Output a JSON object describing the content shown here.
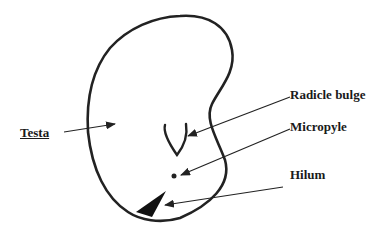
{
  "diagram": {
    "colors": {
      "ink": "#222222",
      "background": "#ffffff"
    },
    "labels": [
      {
        "id": "testa",
        "text": "Testa",
        "underlined": true
      },
      {
        "id": "radicle_bulge",
        "text": "Radicle bulge",
        "underlined": false
      },
      {
        "id": "micropyle",
        "text": "Micropyle",
        "underlined": false
      },
      {
        "id": "hilum",
        "text": "Hilum",
        "underlined": false
      }
    ]
  }
}
